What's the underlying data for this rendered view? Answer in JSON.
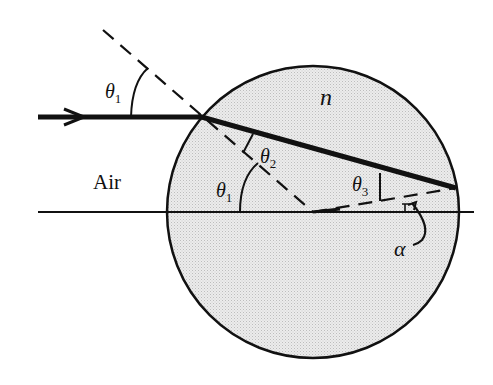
{
  "diagram": {
    "medium_outside_label": "Air",
    "medium_inside_label": "n",
    "angle_labels": {
      "incident_outside": "θ",
      "incident_outside_sub": "1",
      "incident_inside": "θ",
      "incident_inside_sub": "1",
      "refracted": "θ",
      "refracted_sub": "2",
      "exit": "θ",
      "exit_sub": "3",
      "alpha": "α"
    },
    "colors": {
      "sphere_fill": "#e4e4e4",
      "stroke": "#111111",
      "background": "#ffffff"
    }
  }
}
